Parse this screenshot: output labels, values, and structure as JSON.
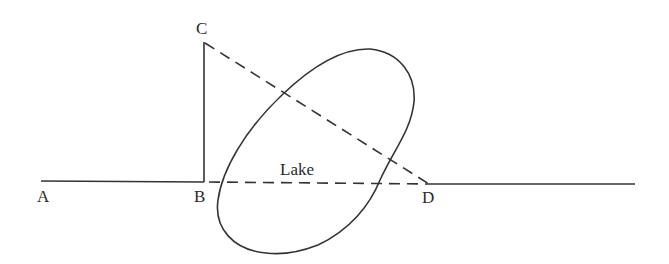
{
  "diagram": {
    "type": "geometry",
    "labels": {
      "A": "A",
      "B": "B",
      "C": "C",
      "D": "D",
      "lake": "Lake"
    },
    "points": {
      "A": [
        41,
        181
      ],
      "B": [
        204,
        182
      ],
      "C": [
        204,
        42
      ],
      "D": [
        429,
        184
      ],
      "line_end": [
        635,
        184
      ]
    },
    "segments": [
      {
        "from": "A",
        "to": "B",
        "style": "solid"
      },
      {
        "from": "B",
        "to": "C",
        "style": "solid"
      },
      {
        "from": "C",
        "to": "D",
        "style": "dashed"
      },
      {
        "from": "B",
        "to": "D",
        "style": "dashed"
      },
      {
        "from": "D",
        "to": "line_end",
        "style": "solid"
      }
    ],
    "shapes": [
      {
        "name": "lake",
        "type": "ellipse",
        "style": "solid"
      }
    ],
    "colors": {
      "stroke": "#333333",
      "background": "#ffffff"
    }
  }
}
